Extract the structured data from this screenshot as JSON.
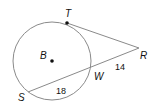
{
  "diagram": {
    "type": "geometry-circle-tangent-secant",
    "colors": {
      "line": "#8a8a8a",
      "point": "#111111",
      "text": "#111111"
    },
    "circle": {
      "center_label": "B",
      "cx": 52,
      "cy": 61,
      "r": 39
    },
    "points": {
      "T": {
        "label": "T",
        "x": 67,
        "y": 23
      },
      "R": {
        "label": "R",
        "x": 139,
        "y": 48
      },
      "W": {
        "label": "W",
        "x": 91,
        "y": 69
      },
      "S": {
        "label": "S",
        "x": 28,
        "y": 92
      },
      "B": {
        "label": "B",
        "x": 52,
        "y": 61
      }
    },
    "segments": [
      {
        "name": "tangent-RT",
        "from": "R",
        "to": "T"
      },
      {
        "name": "secant-RS",
        "from": "R",
        "to": "S"
      }
    ],
    "measures": {
      "RW": "14",
      "WS": "18"
    }
  }
}
